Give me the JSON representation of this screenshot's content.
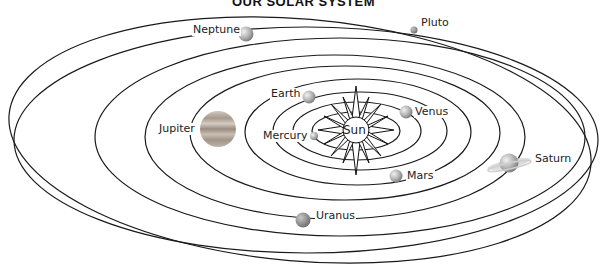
{
  "title": "OUR SOLAR SYSTEM",
  "sun": {
    "label": "Sun",
    "cx": 356,
    "cy": 130
  },
  "planets": [
    {
      "name": "Mercury",
      "label": "Mercury",
      "x": 314,
      "y": 136,
      "r": 4,
      "color": "#b9b9b9"
    },
    {
      "name": "Venus",
      "label": "Venus",
      "x": 406,
      "y": 112,
      "r": 6,
      "color": "#c4c4c4"
    },
    {
      "name": "Earth",
      "label": "Earth",
      "x": 309,
      "y": 97,
      "r": 6,
      "color": "#bdbdbd"
    },
    {
      "name": "Mars",
      "label": "Mars",
      "x": 396,
      "y": 176,
      "r": 6,
      "color": "#a9a9a9"
    },
    {
      "name": "Jupiter",
      "label": "Jupiter",
      "x": 218,
      "y": 129,
      "r": 18,
      "color": "#b8a89a"
    },
    {
      "name": "Saturn",
      "label": "Saturn",
      "x": 509,
      "y": 163,
      "r": 10,
      "color": "#b5b5b5"
    },
    {
      "name": "Uranus",
      "label": "Uranus",
      "x": 303,
      "y": 220,
      "r": 7,
      "color": "#8f8f8f"
    },
    {
      "name": "Neptune",
      "label": "Neptune",
      "x": 246,
      "y": 34,
      "r": 7,
      "color": "#a0a0a0"
    },
    {
      "name": "Pluto",
      "label": "Pluto",
      "x": 414,
      "y": 30,
      "r": 3,
      "color": "#9a9a9a"
    }
  ],
  "orbit_color": "#1a1a1a"
}
